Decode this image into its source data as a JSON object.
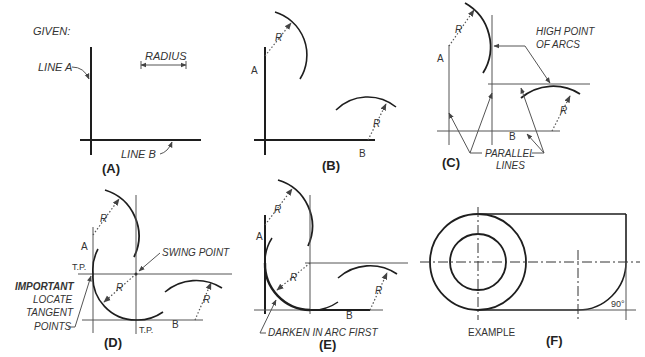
{
  "panels": {
    "A": {
      "caption": "(A)",
      "given_label": "GIVEN:",
      "line_a_label": "LINE A",
      "line_b_label": "LINE B",
      "radius_label": "RADIUS"
    },
    "B": {
      "caption": "(B)",
      "label_a": "A",
      "label_b": "B",
      "r1": "R",
      "r2": "R"
    },
    "C": {
      "caption": "(C)",
      "label_a": "A",
      "label_b": "B",
      "r1": "R",
      "r2": "R",
      "high_point_line1": "HIGH POINT",
      "high_point_line2": "OF ARCS",
      "parallel_line1": "PARALLEL",
      "parallel_line2": "LINES"
    },
    "D": {
      "caption": "(D)",
      "label_a": "A",
      "label_b": "B",
      "r1": "R",
      "r2": "R",
      "r3": "R",
      "tp_left": "T.P.",
      "tp_bottom": "T.P.",
      "swing_point": "SWING POINT",
      "important": "IMPORTANT",
      "note_line1": "LOCATE",
      "note_line2": "TANGENT",
      "note_line3": "POINTS"
    },
    "E": {
      "caption": "(E)",
      "label_a": "A",
      "label_b": "B",
      "r1": "R",
      "r2": "R",
      "r3": "R",
      "darken_note": "DARKEN IN ARC FIRST"
    },
    "F": {
      "caption": "(F)",
      "example_label": "EXAMPLE",
      "angle_label": "90°"
    }
  }
}
